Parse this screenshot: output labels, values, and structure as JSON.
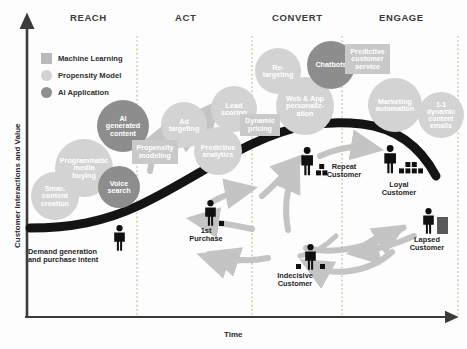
{
  "diagram": {
    "axes": {
      "y_label": "Customer Interactions and Value",
      "x_label": "Time"
    },
    "phases": [
      {
        "label": "REACH",
        "x": 92
      },
      {
        "label": "ACT",
        "x": 190
      },
      {
        "label": "CONVERT",
        "x": 299
      },
      {
        "label": "ENGAGE",
        "x": 399
      }
    ],
    "legend": [
      {
        "label": "Machine Learning",
        "swatch": "square-gray",
        "color": "#b9b9b9"
      },
      {
        "label": "Propensity Model",
        "swatch": "circle-light",
        "color": "#d2d2d2"
      },
      {
        "label": "AI Application",
        "swatch": "circle-dark",
        "color": "#8f8f8f"
      }
    ],
    "bubbles": [
      {
        "label": "Smart\ncontent\ncreation",
        "tone": "light",
        "x": 31,
        "y": 172,
        "d": 48,
        "fs": 7.2
      },
      {
        "label": "Programmatic\nmedia\nbuying",
        "tone": "light",
        "x": 55,
        "y": 139,
        "d": 58,
        "fs": 7.2
      },
      {
        "label": "AI\ngenerated\ncontent",
        "tone": "dark",
        "x": 97,
        "y": 100,
        "d": 52,
        "fs": 7.2
      },
      {
        "label": "Voice\nsearch",
        "tone": "dark",
        "x": 98,
        "y": 166,
        "d": 42,
        "fs": 7.2
      },
      {
        "label": "Ad\ntargeting",
        "tone": "light",
        "x": 161,
        "y": 102,
        "d": 46,
        "fs": 7.2
      },
      {
        "label": "Predictive\nanalytics",
        "tone": "light",
        "x": 194,
        "y": 127,
        "d": 48,
        "fs": 7.2
      },
      {
        "label": "Lead\nscoring",
        "tone": "light",
        "x": 211,
        "y": 86,
        "d": 46,
        "fs": 7.2
      },
      {
        "label": "Re-\ntargeting",
        "tone": "light",
        "x": 255,
        "y": 48,
        "d": 46,
        "fs": 7.2
      },
      {
        "label": "Web & App\npersonaliz-\nation",
        "tone": "light",
        "x": 276,
        "y": 77,
        "d": 58,
        "fs": 7.2
      },
      {
        "label": "Chatbots",
        "tone": "dark",
        "x": 307,
        "y": 41,
        "d": 48,
        "fs": 7.2
      },
      {
        "label": "Marketing\nautomation",
        "tone": "light",
        "x": 368,
        "y": 78,
        "d": 54,
        "fs": 7.2
      },
      {
        "label": "1-1\ndynamic\ncontent\nemails",
        "tone": "light",
        "x": 418,
        "y": 92,
        "d": 46,
        "fs": 7.0
      }
    ],
    "box_labels": [
      {
        "label": "Propensity\nmodeling",
        "x": 132,
        "y": 140,
        "w": 46,
        "h": 24,
        "fs": 7.2
      },
      {
        "label": "Dynamic\npricing",
        "x": 240,
        "y": 114,
        "w": 40,
        "h": 22,
        "fs": 7.2
      },
      {
        "label": "Predictive\ncustomer\nservice",
        "x": 345,
        "y": 44,
        "w": 45,
        "h": 30,
        "fs": 7.2
      }
    ],
    "personas": [
      {
        "name": "Demand generation\nand purchase intent",
        "align": "left",
        "figure_x": 113,
        "figure_y": 225,
        "scale": 1.0,
        "boxes": 0,
        "label_x": 28,
        "label_y": 248,
        "label_w": 92
      },
      {
        "name": "1st\nPurchase",
        "align": "center",
        "figure_x": 204,
        "figure_y": 200,
        "scale": 1.0,
        "boxes": 1,
        "label_x": 178,
        "label_y": 227,
        "label_w": 56
      },
      {
        "name": "Repeat\nCustomer",
        "align": "center",
        "figure_x": 300,
        "figure_y": 147,
        "scale": 1.1,
        "boxes": 3,
        "label_x": 318,
        "label_y": 163,
        "label_w": 52
      },
      {
        "name": "Loyal\nCustomer",
        "align": "center",
        "figure_x": 383,
        "figure_y": 145,
        "scale": 1.1,
        "boxes": 6,
        "label_x": 372,
        "label_y": 181,
        "label_w": 54
      },
      {
        "name": "Lapsed\nCustomer",
        "align": "center",
        "figure_x": 422,
        "figure_y": 208,
        "scale": 1.0,
        "boxes": -1,
        "label_x": 400,
        "label_y": 236,
        "label_w": 54
      },
      {
        "name": "Indecisive\nCustomer",
        "align": "center",
        "figure_x": 295,
        "figure_y": 244,
        "scale": 1.0,
        "boxes": 2,
        "label_x": 268,
        "label_y": 272,
        "label_w": 54
      }
    ],
    "dividers_x": [
      137,
      252,
      342,
      458
    ],
    "colors": {
      "curve": "#1b1b1b",
      "arrow": "#c4c4c4",
      "axis": "#4a4a4a",
      "divider": "#c7a37a",
      "figure": "#101010"
    }
  }
}
